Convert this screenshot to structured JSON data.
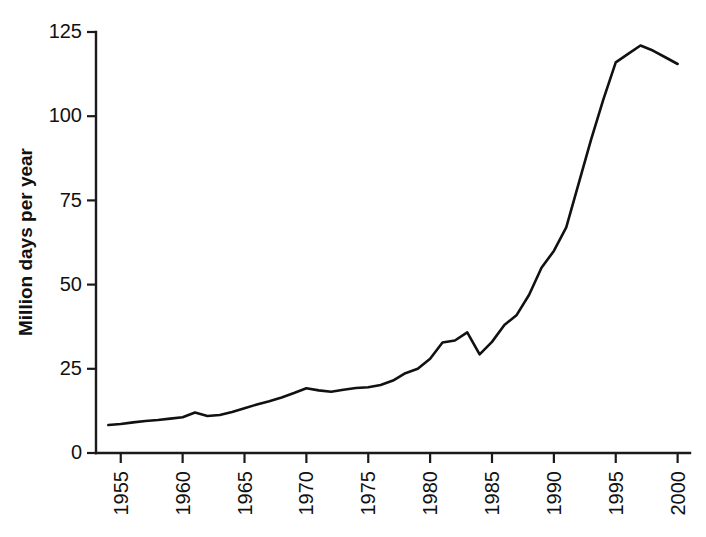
{
  "chart_data": {
    "type": "line",
    "title": "",
    "xlabel": "",
    "ylabel": "Million days per year",
    "xlim": [
      1953,
      2001
    ],
    "ylim": [
      0,
      125
    ],
    "grid": false,
    "legend": null,
    "y_ticks": [
      0,
      25,
      50,
      75,
      100,
      125
    ],
    "y_tick_labels": [
      "0",
      "25",
      "50",
      "75",
      "100",
      "125"
    ],
    "x_ticks": [
      1955,
      1960,
      1965,
      1970,
      1975,
      1980,
      1985,
      1990,
      1995,
      2000
    ],
    "x_tick_labels": [
      "1955",
      "1960",
      "1965",
      "1970",
      "1975",
      "1980",
      "1985",
      "1990",
      "1995",
      "2000"
    ],
    "x_tick_label_rotation": 90,
    "series": [
      {
        "name": "Million days per year",
        "color": "#111111",
        "x": [
          1954,
          1955,
          1956,
          1957,
          1958,
          1959,
          1960,
          1961,
          1962,
          1963,
          1964,
          1965,
          1966,
          1967,
          1968,
          1969,
          1970,
          1971,
          1972,
          1973,
          1974,
          1975,
          1976,
          1977,
          1978,
          1979,
          1980,
          1981,
          1982,
          1983,
          1984,
          1985,
          1986,
          1987,
          1988,
          1989,
          1990,
          1991,
          1992,
          1993,
          1994,
          1995,
          1996,
          1997,
          1998,
          1999,
          2000
        ],
        "values": [
          8.3,
          8.6,
          9.1,
          9.5,
          9.8,
          10.2,
          10.6,
          12.0,
          11.0,
          11.3,
          12.2,
          13.3,
          14.4,
          15.4,
          16.5,
          17.8,
          19.2,
          18.6,
          18.2,
          18.8,
          19.3,
          19.5,
          20.2,
          21.5,
          23.7,
          25.0,
          28.0,
          32.8,
          33.4,
          35.8,
          29.3,
          33.0,
          38.0,
          41.0,
          47.0,
          55.0,
          60.0,
          67.0,
          80.0,
          93.0,
          105.0,
          116.0,
          118.5,
          121.0,
          119.5,
          117.5,
          115.5
        ]
      }
    ]
  },
  "axes": {
    "y_axis_title": "Million days per year"
  }
}
